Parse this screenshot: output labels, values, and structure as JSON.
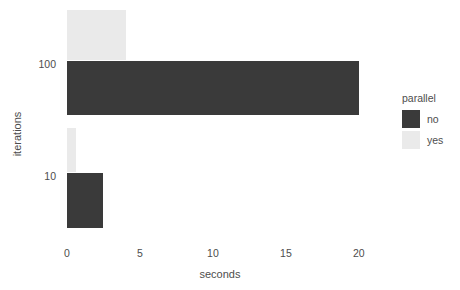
{
  "chart_data": {
    "type": "bar",
    "orientation": "horizontal",
    "title": "",
    "xlabel": "seconds",
    "ylabel": "iterations",
    "categories": [
      "100",
      "10"
    ],
    "xlim": [
      0,
      20.9
    ],
    "xticks": [
      "0",
      "5",
      "10",
      "15",
      "20"
    ],
    "xtick_values": [
      0,
      5,
      10,
      15,
      20
    ],
    "yticks": [
      "100",
      "10"
    ],
    "grid": false,
    "legend": {
      "title": "parallel",
      "position": "right",
      "entries": [
        {
          "label": "no",
          "color": "#3a3a3a"
        },
        {
          "label": "yes",
          "color": "#eaeaea"
        }
      ]
    },
    "series": [
      {
        "name": "no",
        "color": "#3a3a3a",
        "values": [
          20.0,
          2.5
        ]
      },
      {
        "name": "yes",
        "color": "#eaeaea",
        "values": [
          4.05,
          0.65
        ]
      }
    ],
    "bars": [
      {
        "category": "100",
        "parallel": "yes",
        "seconds": 4.05,
        "color": "#eaeaea",
        "top": 10,
        "height": 50
      },
      {
        "category": "100",
        "parallel": "no",
        "seconds": 20.0,
        "color": "#3a3a3a",
        "top": 61,
        "height": 54
      },
      {
        "category": "10",
        "parallel": "yes",
        "seconds": 0.65,
        "color": "#eaeaea",
        "top": 128,
        "height": 44
      },
      {
        "category": "10",
        "parallel": "no",
        "seconds": 2.5,
        "color": "#3a3a3a",
        "top": 173,
        "height": 55
      }
    ],
    "y_tick_positions": [
      65,
      177
    ]
  }
}
